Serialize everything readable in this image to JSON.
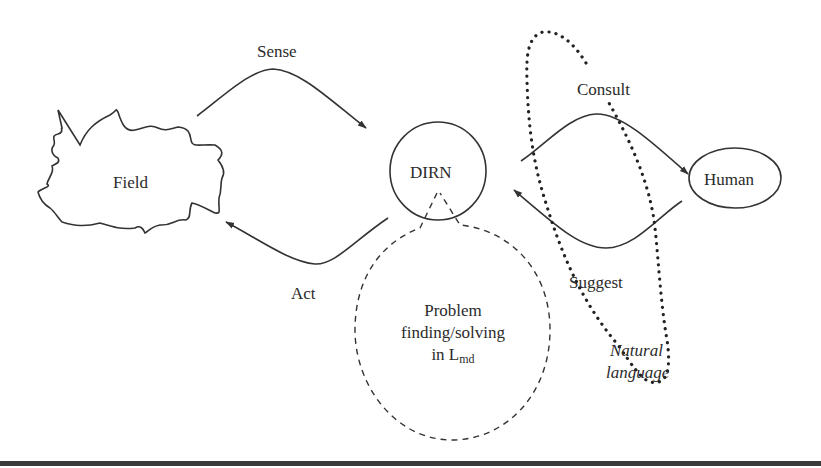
{
  "diagram": {
    "nodes": {
      "field": {
        "label": "Field"
      },
      "dirn": {
        "label": "DIRN"
      },
      "human": {
        "label": "Human"
      },
      "problem": {
        "line1": "Problem",
        "line2": "finding/solving",
        "line3_prefix": "in L",
        "line3_subscript": "md"
      }
    },
    "edges": {
      "sense": {
        "label": "Sense",
        "from": "field",
        "to": "dirn"
      },
      "act": {
        "label": "Act",
        "from": "dirn",
        "to": "field"
      },
      "consult": {
        "label": "Consult",
        "from": "dirn",
        "to": "human"
      },
      "suggest": {
        "label": "Suggest",
        "from": "human",
        "to": "dirn"
      }
    },
    "annotations": {
      "natural_language": {
        "line1": "Natural",
        "line2": "language"
      }
    },
    "colors": {
      "stroke": "#333333",
      "text": "#2b2b2b",
      "background": "#ffffff",
      "rule": "#3a3a3a"
    }
  }
}
